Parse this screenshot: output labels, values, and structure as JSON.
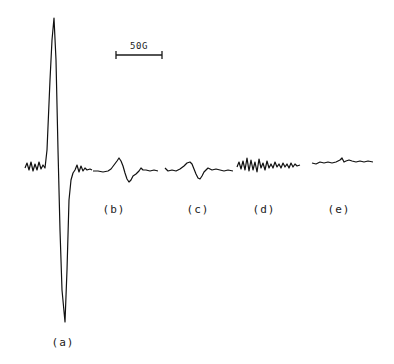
{
  "chart_data": {
    "type": "line",
    "title": "",
    "xlabel": "",
    "ylabel": "",
    "grid": false,
    "legend": "none",
    "scale_bar": {
      "label": "50G",
      "x1": 116,
      "x2": 162,
      "y": 55
    },
    "series": [
      {
        "name": "(a)",
        "label_pos": [
          63,
          343
        ],
        "points": [
          [
            25,
            168
          ],
          [
            27,
            163
          ],
          [
            29,
            170
          ],
          [
            31,
            162
          ],
          [
            33,
            171
          ],
          [
            35,
            164
          ],
          [
            37,
            170
          ],
          [
            39,
            162
          ],
          [
            41,
            169
          ],
          [
            43,
            165
          ],
          [
            45,
            168
          ],
          [
            47,
            150
          ],
          [
            50,
            80
          ],
          [
            52,
            40
          ],
          [
            54,
            18
          ],
          [
            56,
            60
          ],
          [
            58,
            150
          ],
          [
            60,
            230
          ],
          [
            62,
            290
          ],
          [
            65,
            322
          ],
          [
            67,
            270
          ],
          [
            69,
            200
          ],
          [
            71,
            180
          ],
          [
            73,
            173
          ],
          [
            75,
            170
          ],
          [
            77,
            165
          ],
          [
            79,
            172
          ],
          [
            81,
            166
          ],
          [
            83,
            171
          ],
          [
            85,
            168
          ],
          [
            87,
            170
          ],
          [
            90,
            169
          ],
          [
            92,
            170
          ]
        ]
      },
      {
        "name": "(b)",
        "label_pos": [
          114,
          210
        ],
        "points": [
          [
            93,
            171
          ],
          [
            98,
            171
          ],
          [
            103,
            172
          ],
          [
            108,
            171
          ],
          [
            111,
            169
          ],
          [
            114,
            165
          ],
          [
            117,
            161
          ],
          [
            119,
            158
          ],
          [
            121,
            161
          ],
          [
            123,
            166
          ],
          [
            125,
            173
          ],
          [
            127,
            179
          ],
          [
            129,
            182
          ],
          [
            131,
            180
          ],
          [
            133,
            176
          ],
          [
            136,
            174
          ],
          [
            139,
            171
          ],
          [
            141,
            168
          ],
          [
            143,
            170
          ],
          [
            146,
            170
          ],
          [
            150,
            171
          ],
          [
            154,
            170
          ],
          [
            158,
            171
          ]
        ]
      },
      {
        "name": "(c)",
        "label_pos": [
          198,
          210
        ],
        "points": [
          [
            165,
            168
          ],
          [
            168,
            171
          ],
          [
            172,
            170
          ],
          [
            176,
            171
          ],
          [
            180,
            169
          ],
          [
            184,
            166
          ],
          [
            187,
            163
          ],
          [
            190,
            162
          ],
          [
            192,
            164
          ],
          [
            194,
            169
          ],
          [
            196,
            174
          ],
          [
            198,
            178
          ],
          [
            200,
            179
          ],
          [
            202,
            176
          ],
          [
            204,
            172
          ],
          [
            206,
            170
          ],
          [
            208,
            168
          ],
          [
            212,
            170
          ],
          [
            216,
            169
          ],
          [
            220,
            170
          ],
          [
            224,
            171
          ],
          [
            228,
            170
          ],
          [
            233,
            171
          ]
        ]
      },
      {
        "name": "(d)",
        "label_pos": [
          264,
          210
        ],
        "points": [
          [
            237,
            167
          ],
          [
            239,
            162
          ],
          [
            241,
            169
          ],
          [
            243,
            161
          ],
          [
            245,
            170
          ],
          [
            247,
            158
          ],
          [
            249,
            171
          ],
          [
            251,
            160
          ],
          [
            253,
            170
          ],
          [
            255,
            162
          ],
          [
            257,
            172
          ],
          [
            259,
            159
          ],
          [
            261,
            168
          ],
          [
            263,
            163
          ],
          [
            265,
            170
          ],
          [
            267,
            161
          ],
          [
            269,
            168
          ],
          [
            271,
            164
          ],
          [
            273,
            168
          ],
          [
            275,
            162
          ],
          [
            277,
            167
          ],
          [
            279,
            164
          ],
          [
            281,
            168
          ],
          [
            283,
            163
          ],
          [
            285,
            167
          ],
          [
            287,
            164
          ],
          [
            289,
            168
          ],
          [
            291,
            163
          ],
          [
            293,
            167
          ],
          [
            295,
            164
          ],
          [
            297,
            166
          ],
          [
            300,
            165
          ]
        ]
      },
      {
        "name": "(e)",
        "label_pos": [
          339,
          210
        ],
        "points": [
          [
            312,
            163
          ],
          [
            316,
            164
          ],
          [
            320,
            162
          ],
          [
            324,
            163
          ],
          [
            328,
            162
          ],
          [
            332,
            163
          ],
          [
            336,
            162
          ],
          [
            340,
            160
          ],
          [
            342,
            158
          ],
          [
            344,
            162
          ],
          [
            346,
            161
          ],
          [
            349,
            160
          ],
          [
            352,
            161
          ],
          [
            356,
            162
          ],
          [
            360,
            161
          ],
          [
            364,
            162
          ],
          [
            368,
            161
          ],
          [
            373,
            162
          ]
        ]
      }
    ]
  }
}
